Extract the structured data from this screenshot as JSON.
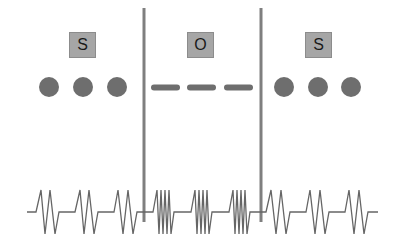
{
  "diagram": {
    "segments": [
      {
        "label": "S",
        "marker": "dot",
        "x_start": 0,
        "x_end": 144
      },
      {
        "label": "O",
        "marker": "dash",
        "x_start": 144,
        "x_end": 261
      },
      {
        "label": "S",
        "marker": "dot",
        "x_start": 261,
        "x_end": 396
      }
    ],
    "dividers_x": [
      144,
      261
    ],
    "colors": {
      "divider": "#7f7f7f",
      "box_fill": "#a6a6a6",
      "marker": "#6e6e6e",
      "waveform": "#666666"
    },
    "waveform": {
      "description": "Slow spike bursts in S regions, fast dense bursts in O region",
      "s_burst_peaks": 2,
      "o_burst_peaks": 4
    }
  }
}
